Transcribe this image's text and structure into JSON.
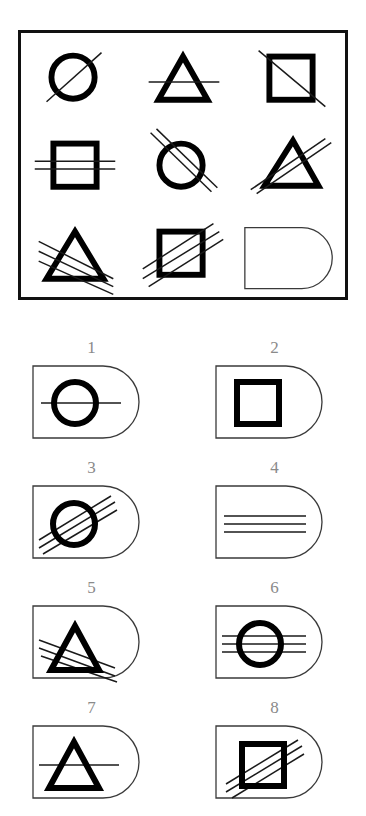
{
  "puzzle": {
    "kind": "visual-analogy-matrix",
    "title_visible": false,
    "matrix": {
      "rows": 3,
      "cols": 3,
      "border_color": "#111111",
      "cells": [
        {
          "position": "r1c1",
          "shape": "circle",
          "overlay": "diagonal-line",
          "line_count": 1,
          "line_orientation": "diagonal",
          "is_answer_slot": false
        },
        {
          "position": "r1c2",
          "shape": "triangle",
          "overlay": "horizontal-line",
          "line_count": 1,
          "line_orientation": "horizontal",
          "is_answer_slot": false
        },
        {
          "position": "r1c3",
          "shape": "square",
          "overlay": "diagonal-line",
          "line_count": 1,
          "line_orientation": "diagonal",
          "is_answer_slot": false
        },
        {
          "position": "r2c1",
          "shape": "square",
          "overlay": "horizontal-lines",
          "line_count": 2,
          "line_orientation": "horizontal",
          "is_answer_slot": false
        },
        {
          "position": "r2c2",
          "shape": "circle",
          "overlay": "diagonal-lines",
          "line_count": 2,
          "line_orientation": "diagonal",
          "is_answer_slot": false
        },
        {
          "position": "r2c3",
          "shape": "triangle",
          "overlay": "diagonal-lines",
          "line_count": 2,
          "line_orientation": "diagonal",
          "is_answer_slot": false
        },
        {
          "position": "r3c1",
          "shape": "triangle",
          "overlay": "diagonal-lines",
          "line_count": 3,
          "line_orientation": "diagonal",
          "is_answer_slot": false
        },
        {
          "position": "r3c2",
          "shape": "square",
          "overlay": "diagonal-lines",
          "line_count": 3,
          "line_orientation": "diagonal",
          "is_answer_slot": false
        },
        {
          "position": "r3c3",
          "shape": "none",
          "overlay": "none",
          "line_count": 0,
          "line_orientation": "none",
          "is_answer_slot": true
        }
      ]
    },
    "options": [
      {
        "number": "1",
        "shape": "circle",
        "line_count": 1,
        "line_orientation": "horizontal"
      },
      {
        "number": "2",
        "shape": "square",
        "line_count": 0,
        "line_orientation": "none"
      },
      {
        "number": "3",
        "shape": "circle",
        "line_count": 3,
        "line_orientation": "diagonal"
      },
      {
        "number": "4",
        "shape": "none",
        "line_count": 3,
        "line_orientation": "horizontal"
      },
      {
        "number": "5",
        "shape": "triangle",
        "line_count": 3,
        "line_orientation": "diagonal"
      },
      {
        "number": "6",
        "shape": "circle",
        "line_count": 3,
        "line_orientation": "horizontal"
      },
      {
        "number": "7",
        "shape": "triangle",
        "line_count": 1,
        "line_orientation": "horizontal"
      },
      {
        "number": "8",
        "shape": "square",
        "line_count": 3,
        "line_orientation": "diagonal"
      }
    ],
    "colors": {
      "ink": "#000000",
      "outline": "#3a3a3a",
      "label": "#8a8a8a",
      "background": "#ffffff"
    }
  }
}
